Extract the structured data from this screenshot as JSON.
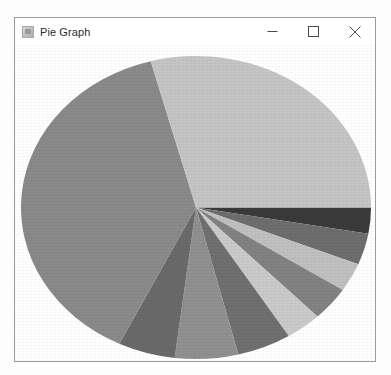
{
  "window": {
    "title": "Pie Graph",
    "icon": "java-app-icon",
    "controls": [
      {
        "name": "minimize-button",
        "glyph": "minimize"
      },
      {
        "name": "maximize-button",
        "glyph": "maximize"
      },
      {
        "name": "close-button",
        "glyph": "close"
      }
    ]
  },
  "colors": {
    "window_background": "#ffffff",
    "window_border": "#9b9b9b",
    "title_text": "#2b2b2b",
    "plot_background": "#ffffff"
  },
  "chart_data": {
    "type": "pie",
    "title": "",
    "xlabel": "",
    "ylabel": "",
    "legend": "none",
    "grid": false,
    "start_angle_deg": 0,
    "direction": "clockwise",
    "center": {
      "x": 196,
      "y": 208
    },
    "radius": {
      "x": 175,
      "y": 152
    },
    "labels": [
      "Slice 1",
      "Slice 2",
      "Slice 3",
      "Slice 4",
      "Slice 5",
      "Slice 6",
      "Slice 7",
      "Slice 8",
      "Slice 9",
      "Slice 10"
    ],
    "values": [
      2.8,
      3.3,
      3.1,
      3.6,
      3.3,
      5.0,
      5.8,
      5.3,
      38.6,
      29.2
    ],
    "angles_deg": [
      10,
      12,
      11,
      13,
      12,
      18,
      21,
      19,
      139,
      105
    ],
    "slice_colors": [
      "#3a3a3a",
      "#6e6e6e",
      "#c0c0c0",
      "#828282",
      "#cacaca",
      "#707070",
      "#909090",
      "#6a6a6a",
      "#8a8a8a",
      "#c5c5c5"
    ]
  }
}
